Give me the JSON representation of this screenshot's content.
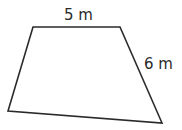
{
  "diagram": {
    "shape": "quadrilateral",
    "stroke_color": "#2a2a2a",
    "fill_color": "#ffffff",
    "vertices": [
      {
        "name": "top-left",
        "x": 33,
        "y": 27
      },
      {
        "name": "top-right",
        "x": 120,
        "y": 27
      },
      {
        "name": "bottom-right",
        "x": 162,
        "y": 123
      },
      {
        "name": "bottom-left",
        "x": 8,
        "y": 111
      }
    ],
    "labels": {
      "top_side": "5 m",
      "right_side": "6 m"
    }
  }
}
